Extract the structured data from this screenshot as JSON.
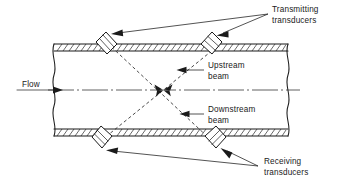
{
  "figure": {
    "type": "schematic-diagram",
    "background_color": "#ffffff",
    "line_color": "#1a1a1a"
  },
  "labels": {
    "flow": "Flow",
    "transmitting_line1": "Transmitting",
    "transmitting_line2": "transducers",
    "upstream_line1": "Upstream",
    "upstream_line2": "beam",
    "downstream_line1": "Downstream",
    "downstream_line2": "beam",
    "receiving_line1": "Receiving",
    "receiving_line2": "transducers"
  },
  "components": {
    "pipe": {
      "name": "pipe-section",
      "wall_style": "hatched-double-line",
      "left_end": "break-line",
      "right_end": "break-line",
      "top_wall_y": 44,
      "bottom_wall_y": 136,
      "left_x": 52,
      "right_x": 288
    },
    "centerline": {
      "name": "pipe-centerline",
      "style": "dash-dot",
      "y": 90
    },
    "transducers": [
      {
        "id": "tx-upper-left",
        "role": "transmitting",
        "position": "top-left",
        "x": 104,
        "y": 40
      },
      {
        "id": "tx-upper-right",
        "role": "transmitting",
        "position": "top-right",
        "x": 209,
        "y": 40
      },
      {
        "id": "rx-lower-left",
        "role": "receiving",
        "position": "bottom-left",
        "x": 104,
        "y": 140
      },
      {
        "id": "rx-lower-right",
        "role": "receiving",
        "position": "bottom-right",
        "x": 209,
        "y": 140
      }
    ],
    "beams": [
      {
        "id": "upstream-beam",
        "from": "tx-upper-right",
        "to": "rx-lower-left",
        "style": "dashed"
      },
      {
        "id": "downstream-beam",
        "from": "tx-upper-left",
        "to": "rx-lower-right",
        "style": "dashed"
      }
    ],
    "flow_arrow": {
      "direction": "right",
      "x_start": 18,
      "x_end": 58,
      "y": 90
    }
  }
}
